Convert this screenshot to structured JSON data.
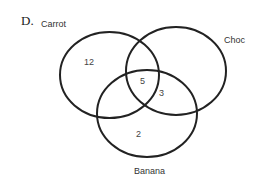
{
  "option_letter": "D.",
  "diagram": {
    "type": "venn3",
    "stroke_color": "#222222",
    "sets": [
      {
        "name": "Carrot",
        "cx": 109.5,
        "cy": 75,
        "rx": 49.5,
        "ry": 43
      },
      {
        "name": "Choc",
        "cx": 176,
        "cy": 71,
        "rx": 50,
        "ry": 44
      },
      {
        "name": "Banana",
        "cx": 147,
        "cy": 113.5,
        "rx": 50,
        "ry": 43.5
      }
    ],
    "regions": [
      {
        "id": "carrot_only",
        "value": "12"
      },
      {
        "id": "carrot_choc_banana",
        "value": "5"
      },
      {
        "id": "choc_banana",
        "value": "3"
      },
      {
        "id": "banana_only",
        "value": "2"
      }
    ]
  }
}
